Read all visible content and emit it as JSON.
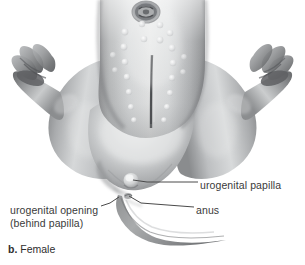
{
  "figure": {
    "caption_letter": "b.",
    "caption_text": "Female",
    "background_color": "#ffffff",
    "line_color": "#4a4a4a",
    "text_color": "#3a3a3a"
  },
  "labels": {
    "urogenital_papilla": "urogenital papilla",
    "anus": "anus",
    "urogenital_opening_line1": "urogenital opening",
    "urogenital_opening_line2": "(behind papilla)"
  },
  "anatomy_parts": [
    {
      "name": "trunk",
      "note": "speckled ventral body surface with midline groove"
    },
    {
      "name": "mouth",
      "note": "oral disc at top of ventral surface"
    },
    {
      "name": "left-hind-limb",
      "note": "bent hind leg with webbed foot and toes"
    },
    {
      "name": "right-hind-limb",
      "note": "bent hind leg with webbed foot and toes"
    },
    {
      "name": "urogenital-papilla",
      "note": "small rounded bump at cloacal region"
    },
    {
      "name": "anus",
      "note": "opening posterior to papilla"
    },
    {
      "name": "tail",
      "note": "curved tapering tail extending lower right"
    }
  ],
  "icons": {
    "leader_line": "leader-line"
  }
}
